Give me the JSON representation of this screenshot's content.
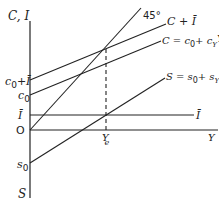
{
  "diagram": {
    "type": "keynesian-cross-income-determination",
    "axes": {
      "vertical_top_label": "C, I",
      "vertical_bottom_label": "S",
      "horizontal_label": "Y",
      "origin_label": "O"
    },
    "vertical_axis_labels": {
      "c0_plus_ibar_main": "c",
      "c0_plus_ibar_sub": "0",
      "c0_plus_ibar_rest": "+Ī",
      "c0_main": "c",
      "c0_sub": "0",
      "ibar": "Ī",
      "s0_main": "s",
      "s0_sub": "0"
    },
    "curves": {
      "deg45": "45°",
      "c_plus_i": "C + Ī",
      "consumption_eq": "C = c",
      "consumption_sub0": "0",
      "consumption_plus": "+ c",
      "consumption_subY": "Y",
      "consumption_Y": "Y",
      "saving_eq": "S = s",
      "saving_sub0": "0",
      "saving_plus": "+ s",
      "saving_subY": "Y",
      "saving_Y": "Y",
      "investment": "Ī"
    },
    "equilibrium": {
      "label_main": "Y",
      "label_sub": "e"
    }
  }
}
